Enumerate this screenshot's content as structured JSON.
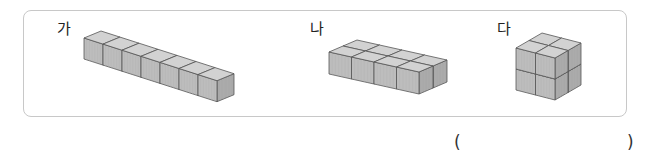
{
  "figures": [
    {
      "label": "가",
      "layout": {
        "cols": 7,
        "rows": 1,
        "layers": 1
      }
    },
    {
      "label": "나",
      "layout": {
        "cols": 4,
        "rows": 2,
        "layers": 1
      }
    },
    {
      "label": "다",
      "layout": {
        "cols": 2,
        "rows": 2,
        "layers": 2
      }
    }
  ],
  "answer": {
    "open": "(",
    "close": ")",
    "value": ""
  },
  "colors": {
    "top": "#d2d2d2",
    "front": "#bdbdbd",
    "side": "#a9a9a9",
    "edge": "#555555",
    "border": "#c8c8c8"
  }
}
